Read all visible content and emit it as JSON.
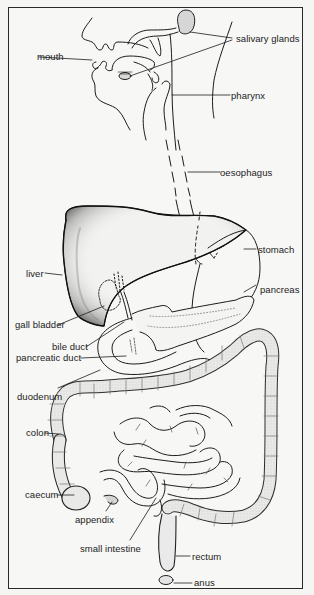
{
  "diagram": {
    "type": "anatomical-illustration",
    "style": "black line drawing with stippled shading",
    "colors": {
      "background": "#f7f7f5",
      "ink": "#1c1c1c",
      "frame": "#2a2a2a"
    },
    "labels": [
      {
        "id": "mouth",
        "text": "mouth"
      },
      {
        "id": "salivary_glands",
        "text": "salivary glands"
      },
      {
        "id": "pharynx",
        "text": "pharynx"
      },
      {
        "id": "oesophagus",
        "text": "oesophagus"
      },
      {
        "id": "stomach",
        "text": "stomach"
      },
      {
        "id": "liver",
        "text": "liver"
      },
      {
        "id": "pancreas",
        "text": "pancreas"
      },
      {
        "id": "gall_bladder",
        "text": "gall bladder"
      },
      {
        "id": "bile_duct",
        "text": "bile duct"
      },
      {
        "id": "pancreatic_duct",
        "text": "pancreatic duct"
      },
      {
        "id": "duodenum",
        "text": "duodenum"
      },
      {
        "id": "colon",
        "text": "colon"
      },
      {
        "id": "caecum",
        "text": "caecum"
      },
      {
        "id": "appendix",
        "text": "appendix"
      },
      {
        "id": "small_intestine",
        "text": "small intestine"
      },
      {
        "id": "rectum",
        "text": "rectum"
      },
      {
        "id": "anus",
        "text": "anus"
      }
    ]
  }
}
